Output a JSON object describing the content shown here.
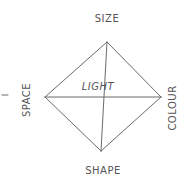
{
  "diagram": {
    "labels": {
      "top": "SIZE",
      "left": "SPACE",
      "right": "COLOUR",
      "bottom": "SHAPE",
      "center": "LIGHT"
    },
    "colors": {
      "stroke": "#6a6a6a",
      "text": "#555555",
      "background": "#ffffff"
    }
  }
}
